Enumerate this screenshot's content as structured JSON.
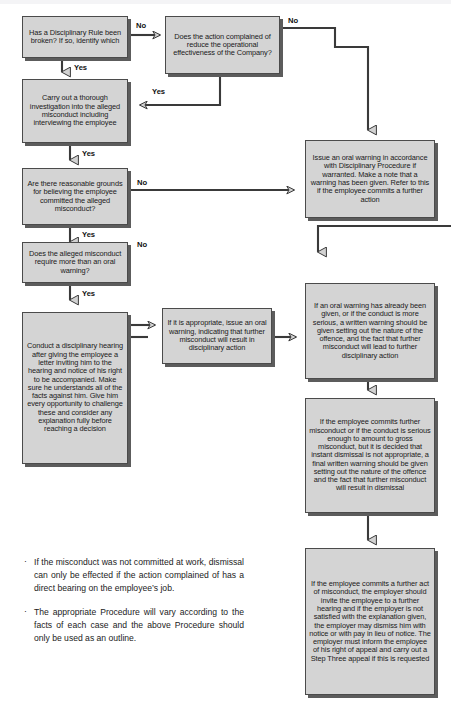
{
  "document": {
    "title": "Disciplinary Procedure Flowchart"
  },
  "flowchart": {
    "type": "flowchart",
    "nodes": [
      {
        "id": "n1",
        "name": "node-disciplinary-rule-broken",
        "text": "Has a Disciplinary Rule been broken? If so, identify which"
      },
      {
        "id": "n2",
        "name": "node-action-reduce-effectiveness",
        "text": "Does the action complained of reduce the operational effectiveness of the Company?"
      },
      {
        "id": "n3",
        "name": "node-carry-out-investigation",
        "text": "Carry out a thorough investigation into the alleged misconduct including interviewing the employee"
      },
      {
        "id": "n4",
        "name": "node-reasonable-grounds",
        "text": "Are there reasonable grounds for believing the employee committed the alleged misconduct?"
      },
      {
        "id": "n5",
        "name": "node-more-than-oral-warning",
        "text": "Does the alleged misconduct require more than an oral warning?"
      },
      {
        "id": "n6",
        "name": "node-conduct-disciplinary-hearing",
        "text": "Conduct a disciplinary hearing after giving the employee a letter inviting him to the hearing and notice of his right to be accompanied. Make sure he understands all of the facts against him. Give him every opportunity to challenge these and consider any explanation fully before reaching a decision"
      },
      {
        "id": "n7",
        "name": "node-issue-oral-warning-if-appropriate",
        "text": "If it is appropriate, issue an oral warning, indicating that further misconduct will result in disciplinary action"
      },
      {
        "id": "n8",
        "name": "node-issue-oral-warning-accordance",
        "text": "Issue an oral warning in accordance with Disciplinary Procedure if warranted. Make a note that a warning has been given. Refer to this if the employee commits a further action"
      },
      {
        "id": "n9",
        "name": "node-written-warning",
        "text": "If an oral warning has already been given, or if the conduct is more serious, a written warning should be given setting out the nature of the offence, and the fact that further misconduct will lead to further disciplinary action"
      },
      {
        "id": "n10",
        "name": "node-final-written-warning",
        "text": "If the employee commits further misconduct or if the conduct is serious enough to amount to gross misconduct, but it is decided that instant dismissal is not appropriate, a final written warning should be given setting out the nature of the offence and the fact that further misconduct will result in dismissal"
      },
      {
        "id": "n11",
        "name": "node-dismissal-step-three",
        "text": "If the employee commits a further act of misconduct, the employer should invite the employee to a further hearing and if the employer is not satisfied with the explanation given, the employer may dismiss him with notice or with pay in lieu of notice. The employer must inform the employee of his right of appeal and carry out a Step Three appeal if this is requested"
      }
    ],
    "edge_labels": [
      {
        "id": "e1",
        "name": "edge-label-no-rule-broken",
        "text": "No"
      },
      {
        "id": "e2",
        "name": "edge-label-yes-rule-broken",
        "text": "Yes"
      },
      {
        "id": "e3",
        "name": "edge-label-no-effectiveness",
        "text": "No"
      },
      {
        "id": "e4",
        "name": "edge-label-yes-effectiveness",
        "text": "Yes"
      },
      {
        "id": "e5",
        "name": "edge-label-yes-investigation",
        "text": "Yes"
      },
      {
        "id": "e6",
        "name": "edge-label-no-grounds",
        "text": "No"
      },
      {
        "id": "e7",
        "name": "edge-label-yes-grounds",
        "text": "Yes"
      },
      {
        "id": "e8",
        "name": "edge-label-no-oral-warning",
        "text": "No"
      },
      {
        "id": "e9",
        "name": "edge-label-yes-oral-warning",
        "text": "Yes"
      }
    ],
    "colors": {
      "box_fill": "#d4d4d4",
      "box_border": "#4b4b4b",
      "box_shadow": "#5c5c5c",
      "arrow": "#3a3a3a",
      "text": "#1a1a1a"
    }
  },
  "notes": {
    "bullet": "·",
    "items": [
      {
        "name": "note-misconduct-outside-work",
        "text": "If the misconduct was not committed at work, dismissal can only be effected if the action complained of has a direct bearing on the employee’s job."
      },
      {
        "name": "note-procedure-outline",
        "text": "The appropriate Procedure will vary according to the facts of each case and the above Procedure should only be used as an outline."
      }
    ]
  }
}
